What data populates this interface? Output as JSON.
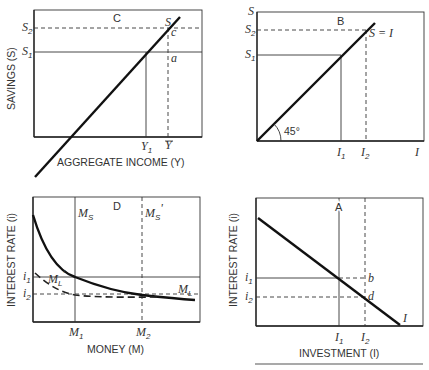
{
  "panels": {
    "C": {
      "letter": "C",
      "x_axis_label": "AGGREGATE INCOME (Y)",
      "y_axis_label": "SAVINGS (S)",
      "curve_label": "S",
      "y_ticks": [
        "S2",
        "S1"
      ],
      "x_ticks": [
        "Y1",
        "Ȳ"
      ],
      "points": [
        "a",
        "c"
      ]
    },
    "B": {
      "letter": "B",
      "y_axis_top_label": "S",
      "x_axis_end_label": "I",
      "curve_label": "S = I",
      "angle_label": "45°",
      "y_ticks": [
        "S2",
        "S1"
      ],
      "x_ticks": [
        "I1",
        "I2"
      ]
    },
    "D": {
      "letter": "D",
      "x_axis_label": "MONEY (M)",
      "y_axis_label": "INTEREST RATE (i)",
      "supply_labels": [
        "MS",
        "MS'"
      ],
      "demand_labels": [
        "ML",
        "ML'"
      ],
      "y_ticks": [
        "i1",
        "i2"
      ],
      "x_ticks": [
        "M1",
        "M2"
      ]
    },
    "A": {
      "letter": "A",
      "x_axis_label": "INVESTMENT (I)",
      "y_axis_label": "INTEREST RATE (i)",
      "curve_label": "I",
      "y_ticks": [
        "i1",
        "i2"
      ],
      "x_ticks": [
        "I1",
        "I2"
      ],
      "points": [
        "b",
        "d"
      ]
    }
  }
}
